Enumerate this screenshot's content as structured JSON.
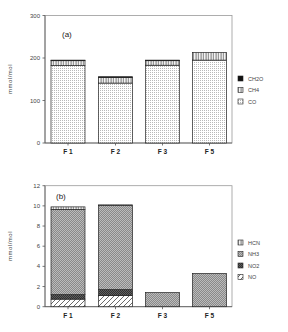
{
  "chart_data": [
    {
      "type": "bar",
      "stacked": true,
      "panel_label": "(a)",
      "title": "",
      "xlabel": "",
      "ylabel": "mmol/mol",
      "ylim": [
        0,
        300
      ],
      "yticks": [
        0,
        100,
        200,
        300
      ],
      "categories": [
        "F 1",
        "F 2",
        "F 3",
        "F 5"
      ],
      "series": [
        {
          "name": "CO",
          "pattern": "dots",
          "values": [
            182,
            141,
            183,
            195
          ]
        },
        {
          "name": "CH4",
          "pattern": "vertical",
          "values": [
            12,
            13,
            11,
            18
          ]
        },
        {
          "name": "CH2O",
          "pattern": "solid",
          "values": [
            1,
            2,
            1,
            0
          ]
        }
      ],
      "legend": {
        "placement": "right",
        "order": [
          "CH2O",
          "CH4",
          "CO"
        ]
      },
      "grid": false
    },
    {
      "type": "bar",
      "stacked": true,
      "panel_label": "(b)",
      "title": "",
      "xlabel": "",
      "ylabel": "mmol/mol",
      "ylim": [
        0,
        12
      ],
      "yticks": [
        0,
        2,
        4,
        6,
        8,
        10,
        12
      ],
      "categories": [
        "F 1",
        "F 2",
        "F 3",
        "F 5"
      ],
      "series": [
        {
          "name": "NO",
          "pattern": "diagonal",
          "values": [
            0.75,
            1.1,
            0,
            0
          ]
        },
        {
          "name": "NO2",
          "pattern": "dark-hatch",
          "values": [
            0.45,
            0.6,
            0,
            0
          ]
        },
        {
          "name": "NH3",
          "pattern": "fine-hatch",
          "values": [
            8.45,
            8.35,
            1.4,
            3.3
          ]
        },
        {
          "name": "HCN",
          "pattern": "vertical",
          "values": [
            0.25,
            0.05,
            0,
            0
          ]
        }
      ],
      "legend": {
        "placement": "right",
        "order": [
          "HCN",
          "NH3",
          "NO2",
          "NO"
        ]
      },
      "grid": false
    }
  ]
}
